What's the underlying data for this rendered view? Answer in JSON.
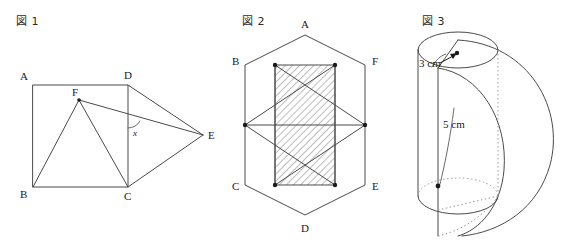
{
  "page": {
    "background_color": "#ffffff",
    "stroke_color": "#4a4a4a",
    "text_color": "#1a1a1a",
    "width": 575,
    "height": 252
  },
  "figures": [
    {
      "caption": "図 1",
      "type": "plane-geometry",
      "description": "Square ABCD with point F inside and point E outside to the right; angle x marked where FE crosses DC.",
      "vertex_labels": [
        "A",
        "B",
        "C",
        "D",
        "E",
        "F"
      ],
      "angle_label": "x",
      "points": {
        "A": [
          33,
          85
        ],
        "B": [
          33,
          187
        ],
        "C": [
          128,
          187
        ],
        "D": [
          128,
          85
        ],
        "E": [
          203,
          135
        ],
        "F": [
          79,
          100
        ]
      },
      "segments": [
        [
          "A",
          "B"
        ],
        [
          "B",
          "C"
        ],
        [
          "C",
          "D"
        ],
        [
          "D",
          "A"
        ],
        [
          "B",
          "F"
        ],
        [
          "F",
          "C"
        ],
        [
          "F",
          "E"
        ],
        [
          "D",
          "E"
        ],
        [
          "C",
          "E"
        ]
      ]
    },
    {
      "caption": "図 2",
      "type": "hexagon-with-inscribed-triangles",
      "description": "Regular hexagon ABCDEF with two inscribed triangles forming a six-pointed star; the central vertical band is hatched.",
      "vertex_labels": [
        "A",
        "B",
        "C",
        "D",
        "E",
        "F"
      ],
      "hatched_region": "central vertical band",
      "marked_points_count": 6
    },
    {
      "caption": "図 3",
      "type": "solid-of-revolution",
      "description": "Cylinder of radius 3 cm and height 5 cm with a swept half-disc / solid of revolution, bottom ellipse drawn dotted.",
      "dimensions": [
        {
          "label": "3 cm",
          "value": 3,
          "unit": "cm",
          "measures": "radius"
        },
        {
          "label": "5 cm",
          "value": 5,
          "unit": "cm",
          "measures": "height"
        }
      ]
    }
  ]
}
